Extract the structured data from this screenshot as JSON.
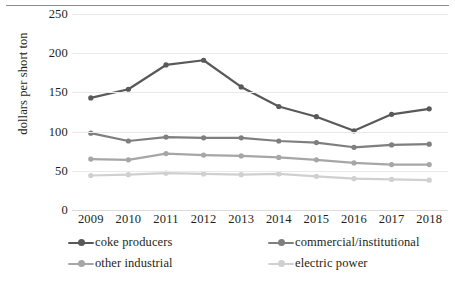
{
  "chart_data": {
    "type": "line",
    "title": "",
    "xlabel": "",
    "ylabel": "dollars per short ton",
    "categories": [
      "2009",
      "2010",
      "2011",
      "2012",
      "2013",
      "2014",
      "2015",
      "2016",
      "2017",
      "2018"
    ],
    "ylim": [
      0,
      250
    ],
    "yticks": [
      0,
      50,
      100,
      150,
      200,
      250
    ],
    "grid": true,
    "legend_position": "bottom",
    "series": [
      {
        "name": "coke producers",
        "color": "#595959",
        "values": [
          143,
          154,
          185,
          191,
          157,
          132,
          119,
          101,
          122,
          129
        ]
      },
      {
        "name": "commercial/institutional",
        "color": "#7f7f7f",
        "values": [
          98,
          88,
          93,
          92,
          92,
          88,
          86,
          80,
          83,
          84
        ]
      },
      {
        "name": "other industrial",
        "color": "#a6a6a6",
        "values": [
          65,
          64,
          72,
          70,
          69,
          67,
          64,
          60,
          58,
          58
        ]
      },
      {
        "name": "electric power",
        "color": "#d0d0d0",
        "values": [
          44,
          45,
          47,
          46,
          45,
          46,
          43,
          40,
          39,
          38
        ]
      }
    ]
  },
  "axis": {
    "ytick_labels": [
      "250",
      "200",
      "150",
      "100",
      "50",
      "0"
    ],
    "xtick_labels": [
      "2009",
      "2010",
      "2011",
      "2012",
      "2013",
      "2014",
      "2015",
      "2016",
      "2017",
      "2018"
    ],
    "ylabel_text": "dollars per short ton"
  },
  "legend": {
    "items": [
      {
        "label": "coke producers",
        "color": "#595959"
      },
      {
        "label": "commercial/institutional",
        "color": "#7f7f7f"
      },
      {
        "label": "other industrial",
        "color": "#a6a6a6"
      },
      {
        "label": "electric power",
        "color": "#d0d0d0"
      }
    ]
  },
  "colors": {
    "text": "#231f20",
    "gridline": "#e9e9e9",
    "top_rule": "#8d8d8d",
    "background": "#ffffff"
  }
}
